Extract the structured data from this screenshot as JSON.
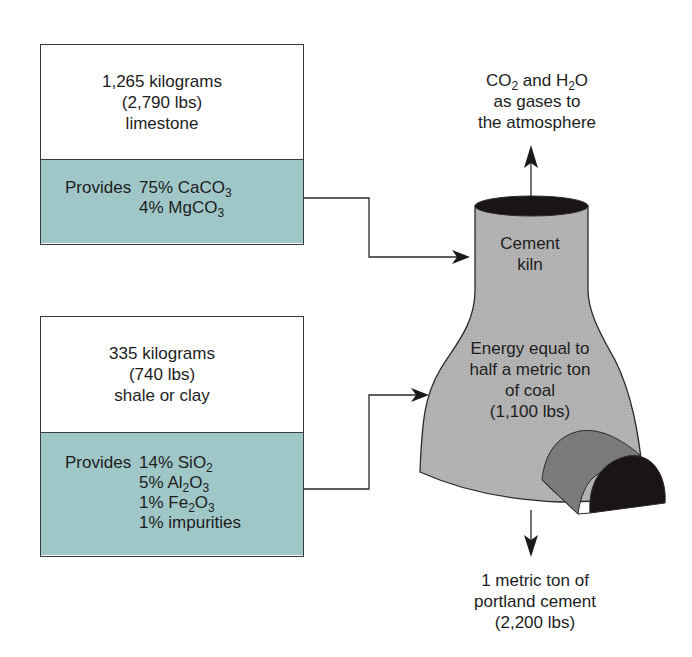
{
  "diagram": {
    "colors": {
      "provides_fill": "#9fc7c7",
      "kiln_fill": "#b3b3b3",
      "kiln_top": "#1a1416",
      "tunnel_side": "#7a7a7a",
      "tunnel_face": "#1a1416",
      "line": "#2a2a2a"
    },
    "inputs": [
      {
        "amount_kg": "1,265 kilograms",
        "amount_lbs": "(2,790 lbs)",
        "material": "limestone",
        "provides_label": "Provides",
        "provides": [
          {
            "pct": "75%",
            "formula": "CaCO",
            "sub": "3"
          },
          {
            "pct": "4%",
            "formula": "MgCO",
            "sub": "3"
          }
        ]
      },
      {
        "amount_kg": "335 kilograms",
        "amount_lbs": "(740 lbs)",
        "material": "shale or clay",
        "provides_label": "Provides",
        "provides": [
          {
            "pct": "14%",
            "formula": "SiO",
            "sub": "2",
            "tail": "",
            "tail_sub": ""
          },
          {
            "pct": "5%",
            "formula": "Al",
            "sub": "2",
            "tail": "O",
            "tail_sub": "3"
          },
          {
            "pct": "1%",
            "formula": "Fe",
            "sub": "2",
            "tail": "O",
            "tail_sub": "3"
          },
          {
            "pct": "1%",
            "formula": "impurities",
            "sub": "",
            "tail": "",
            "tail_sub": ""
          }
        ]
      }
    ],
    "kiln": {
      "name_line1": "Cement",
      "name_line2": "kiln",
      "energy_line1": "Energy equal to",
      "energy_line2": "half a metric ton",
      "energy_line3": "of coal",
      "energy_line4": "(1,100 lbs)"
    },
    "emissions": {
      "co": "CO",
      "co_sub": "2",
      "and_h": " and H",
      "h_sub": "2",
      "o": "O",
      "line2": "as gases to",
      "line3": "the atmosphere"
    },
    "output": {
      "line1": "1 metric ton of",
      "line2": "portland cement",
      "line3": "(2,200 lbs)"
    }
  }
}
